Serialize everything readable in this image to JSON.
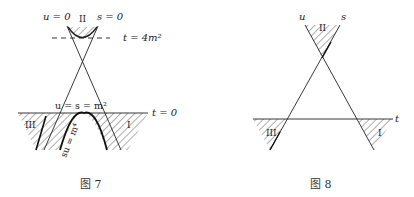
{
  "figures": [
    {
      "id": "fig7",
      "caption": "图 7",
      "labels": {
        "u_zero": "u = 0",
        "s_zero": "s = 0",
        "region_top": "II",
        "threshold": "t = 4m²",
        "threshold_sup": "2",
        "u_eq_s": "u = s = m²",
        "t_zero": "t = 0",
        "region_left": "III",
        "region_right": "I",
        "curve": "su = m⁴"
      }
    },
    {
      "id": "fig8",
      "caption": "图 8",
      "labels": {
        "u_axis": "u",
        "s_axis": "s",
        "t_axis": "t",
        "region_top": "II",
        "region_left": "III",
        "region_right": "I"
      }
    }
  ],
  "colors": {
    "ink": "#222222",
    "hatch": "#333333",
    "background": "#ffffff"
  }
}
